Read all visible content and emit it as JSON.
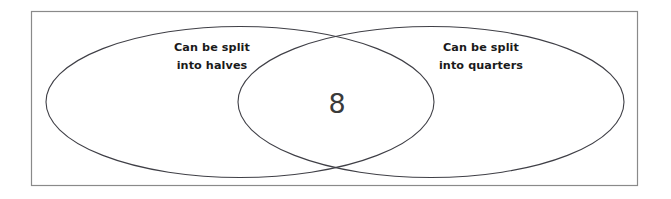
{
  "figure": {
    "type": "venn-diagram",
    "title": "",
    "background_color": "#ffffff",
    "frame": {
      "label": "universal-set-rectangle",
      "stroke_color": "#8a8a8a"
    },
    "ellipse_stroke_color": "#3f3f46",
    "label_color": "#1a1a1a",
    "value_color": "#3a3a3a"
  },
  "sets": [
    {
      "id": "left",
      "label_line1": "Can be split",
      "label_line2": "into halves",
      "label_full": "Can be split into halves",
      "only_value": ""
    },
    {
      "id": "right",
      "label_line1": "Can be split",
      "label_line2": "into quarters",
      "label_full": "Can be split into quarters",
      "only_value": ""
    }
  ],
  "intersection": {
    "label": "left-and-right-intersection",
    "value": "8"
  }
}
